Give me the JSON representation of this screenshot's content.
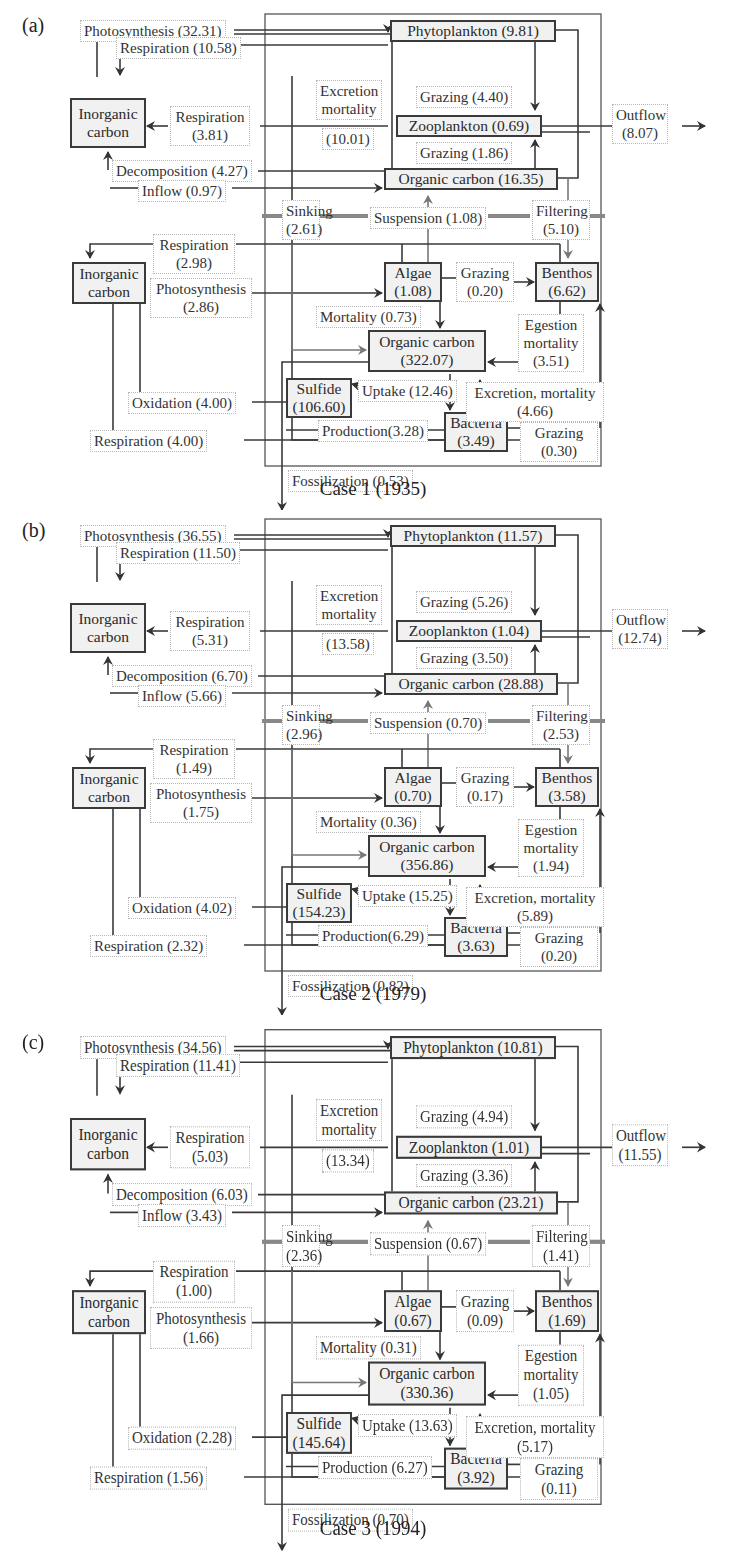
{
  "panels": [
    {
      "tag": "(a)",
      "caption": "Case 1 (1935)",
      "nodes": {
        "inorganic_top": "Inorganic carbon",
        "phytoplankton": "Phytoplankton (9.81)",
        "zooplankton": "Zooplankton (0.69)",
        "organic_water": "Organic carbon (16.35)",
        "inorganic_bottom": "Inorganic carbon",
        "algae_name": "Algae",
        "algae_val": "(1.08)",
        "benthos_name": "Benthos",
        "benthos_val": "(6.62)",
        "organic_sed_name": "Organic carbon",
        "organic_sed_val": "(322.07)",
        "sulfide_name": "Sulfide",
        "sulfide_val": "(106.60)",
        "bacteria_name": "Bacteria",
        "bacteria_val": "(3.49)"
      },
      "flows": {
        "photosynthesis_water": "Photosynthesis (32.31)",
        "respiration_phyto": "Respiration (10.58)",
        "respiration_zoo_1": "Respiration",
        "respiration_zoo_2": "(3.81)",
        "excretion_1": "Excretion",
        "excretion_2": "mortality",
        "excretion_3": "(10.01)",
        "grazing_phyto": "Grazing (4.40)",
        "grazing_org": "Grazing (1.86)",
        "decomposition": "Decomposition (4.27)",
        "inflow": "Inflow (0.97)",
        "outflow_1": "Outflow",
        "outflow_2": "(8.07)",
        "sinking_1": "Sinking",
        "sinking_2": "(2.61)",
        "suspension": "Suspension (1.08)",
        "filtering_1": "Filtering",
        "filtering_2": "(5.10)",
        "respiration_benthic_1": "Respiration",
        "respiration_benthic_2": "(2.98)",
        "photosynthesis_benthic_1": "Photosynthesis",
        "photosynthesis_benthic_2": "(2.86)",
        "grazing_algae_1": "Grazing",
        "grazing_algae_2": "(0.20)",
        "mortality": "Mortality (0.73)",
        "egestion_1": "Egestion",
        "egestion_2": "mortality",
        "egestion_3": "(3.51)",
        "oxidation": "Oxidation (4.00)",
        "uptake": "Uptake (12.46)",
        "excretion_bact_1": "Excretion, mortality",
        "excretion_bact_2": "(4.66)",
        "production": "Production(3.28)",
        "respiration_bact": "Respiration (4.00)",
        "grazing_bact_1": "Grazing",
        "grazing_bact_2": "(0.30)",
        "fossilization": "Fossilization (0.53)"
      }
    },
    {
      "tag": "(b)",
      "caption": "Case 2 (1979)",
      "nodes": {
        "inorganic_top": "Inorganic carbon",
        "phytoplankton": "Phytoplankton (11.57)",
        "zooplankton": "Zooplankton (1.04)",
        "organic_water": "Organic carbon (28.88)",
        "inorganic_bottom": "Inorganic carbon",
        "algae_name": "Algae",
        "algae_val": "(0.70)",
        "benthos_name": "Benthos",
        "benthos_val": "(3.58)",
        "organic_sed_name": "Organic carbon",
        "organic_sed_val": "(356.86)",
        "sulfide_name": "Sulfide",
        "sulfide_val": "(154.23)",
        "bacteria_name": "Bacteria",
        "bacteria_val": "(3.63)"
      },
      "flows": {
        "photosynthesis_water": "Photosynthesis (36.55)",
        "respiration_phyto": "Respiration (11.50)",
        "respiration_zoo_1": "Respiration",
        "respiration_zoo_2": "(5.31)",
        "excretion_1": "Excretion",
        "excretion_2": "mortality",
        "excretion_3": "(13.58)",
        "grazing_phyto": "Grazing (5.26)",
        "grazing_org": "Grazing (3.50)",
        "decomposition": "Decomposition (6.70)",
        "inflow": "Inflow (5.66)",
        "outflow_1": "Outflow",
        "outflow_2": "(12.74)",
        "sinking_1": "Sinking",
        "sinking_2": "(2.96)",
        "suspension": "Suspension (0.70)",
        "filtering_1": "Filtering",
        "filtering_2": "(2.53)",
        "respiration_benthic_1": "Respiration",
        "respiration_benthic_2": "(1.49)",
        "photosynthesis_benthic_1": "Photosynthesis",
        "photosynthesis_benthic_2": "(1.75)",
        "grazing_algae_1": "Grazing",
        "grazing_algae_2": "(0.17)",
        "mortality": "Mortality (0.36)",
        "egestion_1": "Egestion",
        "egestion_2": "mortality",
        "egestion_3": "(1.94)",
        "oxidation": "Oxidation (4.02)",
        "uptake": "Uptake (15.25)",
        "excretion_bact_1": "Excretion, mortality",
        "excretion_bact_2": "(5.89)",
        "production": "Production(6.29)",
        "respiration_bact": "Respiration (2.32)",
        "grazing_bact_1": "Grazing",
        "grazing_bact_2": "(0.20)",
        "fossilization": "Fossilization (0.82)"
      }
    },
    {
      "tag": "(c)",
      "caption": "Case 3 (1994)",
      "nodes": {
        "inorganic_top": "Inorganic carbon",
        "phytoplankton": "Phytoplankton (10.81)",
        "zooplankton": "Zooplankton (1.01)",
        "organic_water": "Organic carbon (23.21)",
        "inorganic_bottom": "Inorganic carbon",
        "algae_name": "Algae",
        "algae_val": "(0.67)",
        "benthos_name": "Benthos",
        "benthos_val": "(1.69)",
        "organic_sed_name": "Organic carbon",
        "organic_sed_val": "(330.36)",
        "sulfide_name": "Sulfide",
        "sulfide_val": "(145.64)",
        "bacteria_name": "Bacteria",
        "bacteria_val": "(3.92)"
      },
      "flows": {
        "photosynthesis_water": "Photosynthesis (34.56)",
        "respiration_phyto": "Respiration (11.41)",
        "respiration_zoo_1": "Respiration",
        "respiration_zoo_2": "(5.03)",
        "excretion_1": "Excretion",
        "excretion_2": "mortality",
        "excretion_3": "(13.34)",
        "grazing_phyto": "Grazing (4.94)",
        "grazing_org": "Grazing (3.36)",
        "decomposition": "Decomposition (6.03)",
        "inflow": "Inflow (3.43)",
        "outflow_1": "Outflow",
        "outflow_2": "(11.55)",
        "sinking_1": "Sinking",
        "sinking_2": "(2.36)",
        "suspension": "Suspension (0.67)",
        "filtering_1": "Filtering",
        "filtering_2": "(1.41)",
        "respiration_benthic_1": "Respiration",
        "respiration_benthic_2": "(1.00)",
        "photosynthesis_benthic_1": "Photosynthesis",
        "photosynthesis_benthic_2": "(1.66)",
        "grazing_algae_1": "Grazing",
        "grazing_algae_2": "(0.09)",
        "mortality": "Mortality (0.31)",
        "egestion_1": "Egestion",
        "egestion_2": "mortality",
        "egestion_3": "(1.05)",
        "oxidation": "Oxidation (2.28)",
        "uptake": "Uptake (13.63)",
        "excretion_bact_1": "Excretion, mortality",
        "excretion_bact_2": "(5.17)",
        "production": "Production (6.27)",
        "respiration_bact": "Respiration (1.56)",
        "grazing_bact_1": "Grazing",
        "grazing_bact_2": "(0.11)",
        "fossilization": "Fossilization (0.70)"
      }
    }
  ]
}
